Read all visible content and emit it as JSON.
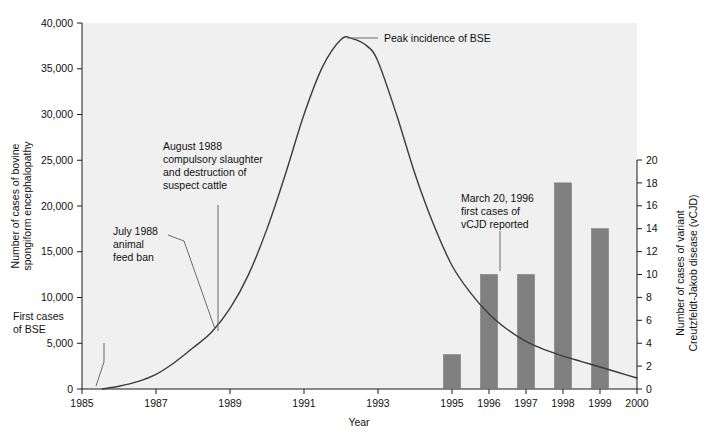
{
  "chart_data": {
    "type": "line",
    "title": "",
    "xlabel": "Year",
    "ylabel_left_line1": "Number of cases of bovine",
    "ylabel_left_line2": "spongiform encephalopathy",
    "ylabel_right_line1": "Number of cases of variant",
    "ylabel_right_line2": "Creutzfeldt-Jakob disease (vCJD)",
    "xlim": [
      1985,
      2000
    ],
    "xticks": [
      1985,
      1987,
      1989,
      1991,
      1993,
      1995,
      1996,
      1997,
      1998,
      1999,
      2000
    ],
    "xtick_labels": [
      "1985",
      "1987",
      "1989",
      "1991",
      "1993",
      "1995",
      "1996",
      "1997",
      "1998",
      "1999",
      "2000"
    ],
    "ylim_left": [
      0,
      40000
    ],
    "yticks_left": [
      0,
      5000,
      10000,
      15000,
      20000,
      25000,
      30000,
      35000,
      40000
    ],
    "ytick_labels_left": [
      "0",
      "5,000",
      "10,000",
      "15,000",
      "20,000",
      "25,000",
      "30,000",
      "35,000",
      "40,000"
    ],
    "ylim_right": [
      0,
      20
    ],
    "yticks_right": [
      0,
      2,
      4,
      6,
      8,
      10,
      12,
      14,
      16,
      18,
      20
    ],
    "ytick_labels_right": [
      "0",
      "2",
      "4",
      "6",
      "8",
      "10",
      "12",
      "14",
      "16",
      "18",
      "20"
    ],
    "grid": false,
    "legend": "none",
    "series": [
      {
        "name": "BSE cases (bovine spongiform encephalopathy)",
        "axis": "left",
        "type": "line",
        "color": "#3c3c3c",
        "x": [
          1985.55,
          1986.0,
          1986.5,
          1987.0,
          1987.5,
          1988.0,
          1988.5,
          1989.0,
          1989.5,
          1990.0,
          1990.5,
          1991.0,
          1991.5,
          1992.0,
          1992.3,
          1992.7,
          1993.0,
          1993.5,
          1994.0,
          1994.5,
          1995.0,
          1995.5,
          1996.0,
          1996.5,
          1997.0,
          1997.5,
          1998.0,
          1998.5,
          1999.0,
          1999.5,
          2000.0
        ],
        "y": [
          0,
          300,
          800,
          1600,
          2900,
          4500,
          6200,
          8800,
          12500,
          17500,
          23500,
          30000,
          35200,
          38200,
          38300,
          37500,
          35800,
          30000,
          23500,
          18000,
          13500,
          10500,
          8200,
          6500,
          5200,
          4300,
          3600,
          3000,
          2400,
          1800,
          1200
        ]
      },
      {
        "name": "vCJD cases (variant Creutzfeldt-Jakob disease)",
        "axis": "right",
        "type": "bar",
        "color": "#808080",
        "categories": [
          "1995",
          "1996",
          "1997",
          "1998",
          "1999"
        ],
        "values": [
          3,
          10,
          10,
          18,
          14
        ]
      }
    ],
    "annotations": [
      {
        "id": "first-cases-of-bse",
        "lines": [
          "First cases",
          "of BSE"
        ],
        "text_x": 13,
        "text_y": 320,
        "leader": "M 104 343 L 104 362 L 96 386"
      },
      {
        "id": "july-1988-animal-feed-ban",
        "lines": [
          "July 1988",
          "animal",
          "feed ban"
        ],
        "text_x": 113,
        "text_y": 235,
        "leader": "M 168 235 L 184 241 L 215 329"
      },
      {
        "id": "august-1988-compulsory-slaughter",
        "lines": [
          "August 1988",
          "compulsory slaughter",
          "and destruction of",
          "suspect cattle"
        ],
        "text_x": 163,
        "text_y": 150,
        "leader": "M 218 205 L 218 331"
      },
      {
        "id": "peak-incidence-of-bse",
        "lines": [
          "Peak incidence of BSE"
        ],
        "text_x": 384,
        "text_y": 42,
        "leader": "M 347 38 L 378 38"
      },
      {
        "id": "march-20-1996-first-cases-vcjd",
        "lines": [
          "March 20, 1996",
          "first cases of",
          "vCJD reported"
        ],
        "text_x": 461,
        "text_y": 202,
        "leader": "M 500 231 L 500 271"
      }
    ]
  },
  "colors": {
    "plot_background": "#f0f0f0",
    "page_background": "#ffffff",
    "curve": "#3c3c3c",
    "bar": "#808080",
    "axis": "#1a1a1a",
    "text": "#111111",
    "leader": "#6b6b6b"
  }
}
